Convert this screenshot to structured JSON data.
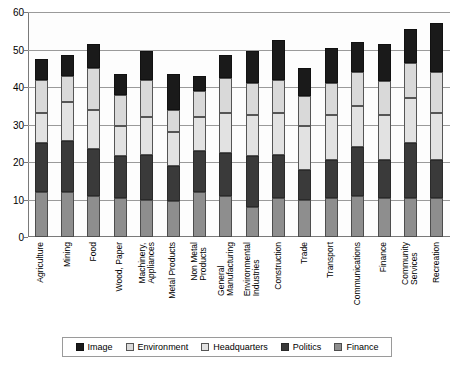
{
  "chart_data": {
    "type": "bar",
    "title": "",
    "xlabel": "",
    "ylabel": "",
    "ylim": [
      0,
      60
    ],
    "yticks": [
      0,
      10,
      20,
      30,
      40,
      50,
      60
    ],
    "grid": true,
    "stacked": true,
    "legend_position": "bottom",
    "categories": [
      "Agriculture",
      "Mining",
      "Food",
      "Wood, Paper",
      "Machinery,\nAppliances",
      "Metal Products",
      "Non Metal\nProducts",
      "General\nManufacturing",
      "Environmental\nIndustries",
      "Construction",
      "Trade",
      "Transport",
      "Communications",
      "Finance",
      "Community\nServices",
      "Recreation"
    ],
    "series": [
      {
        "name": "Finance",
        "swatch": "#8e8e8e",
        "values": [
          12.0,
          12.0,
          11.0,
          10.5,
          10.0,
          9.5,
          12.0,
          11.0,
          8.0,
          10.5,
          10.0,
          10.5,
          11.0,
          10.5,
          10.5,
          10.5
        ]
      },
      {
        "name": "Politics",
        "swatch": "#3a3a3a",
        "values": [
          13.0,
          13.5,
          12.5,
          11.0,
          12.0,
          9.5,
          11.0,
          11.5,
          13.5,
          11.5,
          8.0,
          10.0,
          13.0,
          10.0,
          14.5,
          10.0
        ]
      },
      {
        "name": "Headquarters",
        "swatch": "#ffffff",
        "values": [
          8.0,
          10.5,
          10.5,
          8.0,
          10.0,
          9.0,
          9.0,
          10.5,
          11.0,
          11.0,
          11.5,
          12.0,
          11.0,
          12.0,
          12.0,
          12.5
        ]
      },
      {
        "name": "Environment",
        "swatch": "#d9d9d9",
        "values": [
          9.0,
          7.0,
          11.0,
          8.5,
          10.0,
          6.0,
          7.0,
          9.5,
          8.5,
          9.0,
          8.0,
          8.5,
          9.0,
          9.0,
          9.5,
          11.0
        ]
      },
      {
        "name": "Image",
        "swatch": "#1a1a1a",
        "values": [
          5.5,
          5.5,
          6.5,
          5.5,
          7.5,
          9.5,
          4.0,
          6.0,
          8.5,
          10.5,
          7.5,
          9.5,
          8.0,
          10.0,
          9.0,
          13.0
        ]
      }
    ],
    "totals": [
      47.5,
      48.5,
      51.5,
      43.5,
      49.5,
      43.5,
      43.0,
      48.5,
      49.5,
      52.5,
      45.0,
      50.5,
      52.0,
      51.5,
      55.5,
      57.0
    ]
  },
  "legend": {
    "items": [
      {
        "label": "Image"
      },
      {
        "label": "Environment"
      },
      {
        "label": "Headquarters"
      },
      {
        "label": "Politics"
      },
      {
        "label": "Finance"
      }
    ]
  }
}
